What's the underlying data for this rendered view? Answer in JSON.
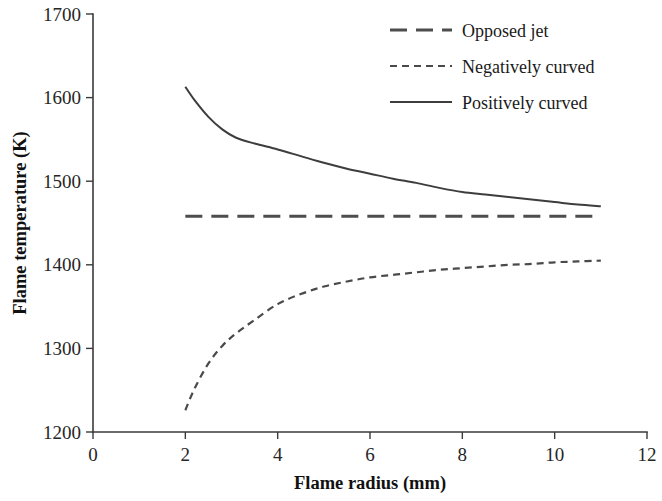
{
  "chart_data": {
    "type": "line",
    "title": "",
    "xlabel": "Flame radius (mm)",
    "ylabel": "Flame temperature (K)",
    "xlim": [
      0,
      12
    ],
    "ylim": [
      1200,
      1700
    ],
    "xticks": [
      "0",
      "2",
      "4",
      "6",
      "8",
      "10",
      "12"
    ],
    "yticks": [
      "1200",
      "1300",
      "1400",
      "1500",
      "1600",
      "1700"
    ],
    "grid": false,
    "legend_position": "top-right",
    "series": [
      {
        "name": "Opposed jet",
        "style": "long-dashed",
        "x": [
          2.0,
          11.0
        ],
        "values": [
          1458,
          1458
        ]
      },
      {
        "name": "Negatively curved",
        "style": "short-dashed",
        "x": [
          2.0,
          2.2,
          2.5,
          2.8,
          3.1,
          3.5,
          4.0,
          4.5,
          5.0,
          5.5,
          6.0,
          6.5,
          7.0,
          7.5,
          8.0,
          8.5,
          9.0,
          9.5,
          10.0,
          10.5,
          11.0
        ],
        "values": [
          1226,
          1252,
          1282,
          1303,
          1318,
          1334,
          1353,
          1365,
          1374,
          1380,
          1385,
          1388,
          1391,
          1394,
          1396,
          1398,
          1400,
          1401,
          1403,
          1404,
          1405
        ]
      },
      {
        "name": "Positively curved",
        "style": "solid",
        "x": [
          2.0,
          2.2,
          2.5,
          2.8,
          3.1,
          3.5,
          4.0,
          4.5,
          5.0,
          5.5,
          6.0,
          6.5,
          7.0,
          7.5,
          8.0,
          8.5,
          9.0,
          9.5,
          10.0,
          10.5,
          11.0
        ],
        "values": [
          1613,
          1597,
          1577,
          1562,
          1552,
          1545,
          1538,
          1530,
          1522,
          1515,
          1509,
          1503,
          1498,
          1492,
          1487,
          1484,
          1481,
          1478,
          1475,
          1472,
          1470
        ]
      }
    ]
  },
  "legend": {
    "items": [
      {
        "label": "Opposed jet",
        "style": "long-dashed"
      },
      {
        "label": "Negatively curved",
        "style": "short-dashed"
      },
      {
        "label": "Positively curved",
        "style": "solid"
      }
    ]
  }
}
